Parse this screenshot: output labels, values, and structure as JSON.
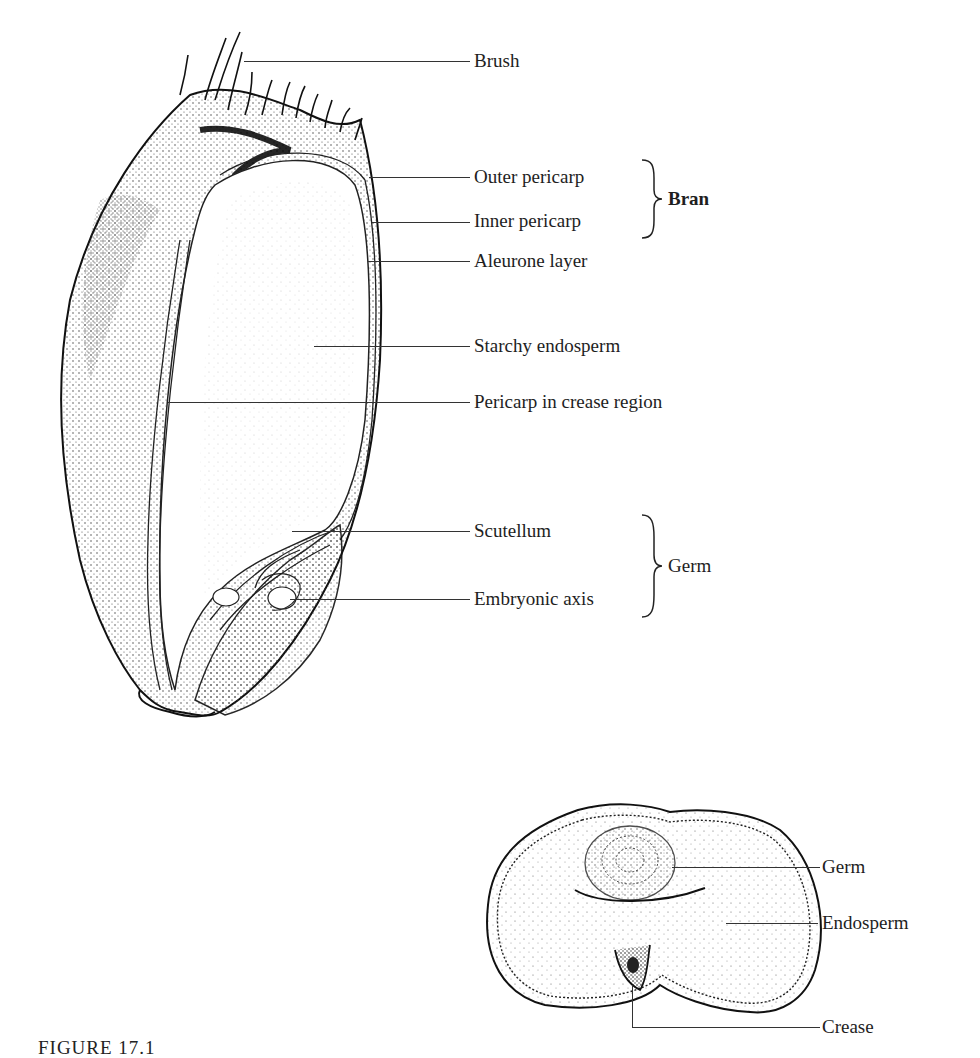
{
  "figure": {
    "caption_partial": "FIGURE 17.1"
  },
  "longitudinal_section": {
    "labels": [
      {
        "id": "brush",
        "text": "Brush"
      },
      {
        "id": "outer_pericarp",
        "text": "Outer pericarp"
      },
      {
        "id": "inner_pericarp",
        "text": "Inner pericarp"
      },
      {
        "id": "aleurone_layer",
        "text": "Aleurone layer"
      },
      {
        "id": "starchy_endosperm",
        "text": "Starchy endosperm"
      },
      {
        "id": "pericarp_crease",
        "text": "Pericarp in crease region"
      },
      {
        "id": "scutellum",
        "text": "Scutellum"
      },
      {
        "id": "embryonic_axis",
        "text": "Embryonic axis"
      }
    ],
    "groups": [
      {
        "id": "bran",
        "text": "Bran",
        "members": [
          "Outer pericarp",
          "Inner pericarp"
        ]
      },
      {
        "id": "germ",
        "text": "Germ",
        "members": [
          "Scutellum",
          "Embryonic axis"
        ]
      }
    ]
  },
  "cross_section": {
    "labels": [
      {
        "id": "germ",
        "text": "Germ"
      },
      {
        "id": "endosperm",
        "text": "Endosperm"
      },
      {
        "id": "crease",
        "text": "Crease"
      }
    ]
  }
}
